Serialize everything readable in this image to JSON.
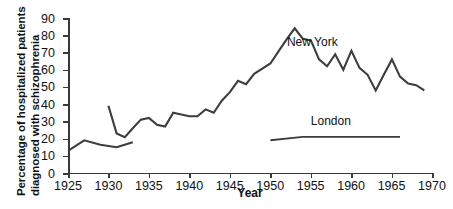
{
  "chart_data": {
    "type": "line",
    "title": "",
    "xlabel": "Year",
    "ylabel": "Percentage of hospitalized patients diagnosed with schizophrenia",
    "ylabel_line1": "Percentage of hospitalized patients",
    "ylabel_line2": "diagnosed with schizophrenia",
    "xlim": [
      1925,
      1970
    ],
    "ylim": [
      0,
      90
    ],
    "xticks": [
      1925,
      1930,
      1935,
      1940,
      1945,
      1950,
      1955,
      1960,
      1965,
      1970
    ],
    "xticklabels": [
      "1925",
      "1930",
      "1935",
      "1940",
      "1945",
      "1950",
      "1955",
      "1960",
      "1965",
      "1970"
    ],
    "yticks": [
      0,
      10,
      20,
      30,
      40,
      50,
      60,
      70,
      80,
      90
    ],
    "yticklabels": [
      "0",
      "10",
      "20",
      "30",
      "40",
      "50",
      "60",
      "70",
      "80",
      "90"
    ],
    "grid": false,
    "legend_position": "inline-annotations",
    "line_color": "#3d3d3d",
    "background_color": "#ffffff",
    "series": [
      {
        "name": "New York",
        "annotation": "New York",
        "annotation_x": 1955.2,
        "annotation_y": 76,
        "x": [
          1925,
          1926,
          1928,
          1931,
          1933,
          1930,
          1931,
          1932,
          1933,
          1934,
          1935,
          1936,
          1937,
          1938,
          1939,
          1940,
          1941,
          1942,
          1943,
          1944,
          1945,
          1946,
          1947,
          1948,
          1949,
          1950,
          1951,
          1952,
          1953,
          1954,
          1955,
          1956,
          1957,
          1958,
          1959,
          1960,
          1961,
          1962,
          1963,
          1964,
          1965,
          1966,
          1967,
          1968,
          1969
        ],
        "values": [
          12,
          19,
          17,
          15,
          18,
          39,
          23,
          21,
          26,
          31,
          32,
          28,
          27,
          35,
          34,
          33,
          33,
          37,
          35,
          42,
          47,
          53,
          51,
          57,
          60,
          63,
          70,
          77,
          86,
          80,
          79,
          68,
          64,
          71,
          62,
          73,
          63,
          59,
          50,
          59,
          68,
          58,
          54,
          53,
          50
        ]
      },
      {
        "name": "New York early",
        "x": [
          1925,
          1926,
          1928,
          1931,
          1933
        ],
        "values": [
          12,
          19,
          17,
          15,
          18
        ]
      },
      {
        "name": "London",
        "annotation": "London",
        "annotation_x": 1957.5,
        "annotation_y": 30,
        "x": [
          1950,
          1954,
          1966
        ],
        "values": [
          19,
          21,
          21
        ]
      }
    ],
    "series_paths": {
      "new_york_early": "M 0,132.8 L 16.2,122.3 L 32.4,126.8 L 48.6,129.2 L 64.8,124.2",
      "new_york_main": "M 40.4,87.8 L 48.6,115.4 L 56.8,119.2 L 64.8,110.2 L 72.8,101.6 L 80.9,99.9 L 89.0,106.8 L 97.1,108.6 L 105.2,94.8 L 113.3,96.6 L 121.4,98.3 L 129.5,98.3 L 137.6,91.4 L 145.7,94.8 L 153.8,82.7 L 161.9,74.1 L 170.0,62.8 L 178.1,66.2 L 186.2,55.9 L 194.3,50.7 L 202.4,45.5 L 210.5,33.4 L 218.6,21.3 L 226.7,10.3 L 234.8,20.7 L 242.9,22.4 L 251.0,41.4 L 259.1,48.3 L 267.2,36.2 L 275.3,51.7 L 283.4,32.7 L 291.5,49.9 L 299.6,56.8 L 307.7,72.4 L 315.8,56.8 L 323.9,41.4 L 332.0,58.6 L 340.1,65.5 L 348.2,67.2 L 356.3,72.4",
      "london": "M 202.4,122.3 L 234.8,118.9 L 332.0,118.9"
    }
  }
}
